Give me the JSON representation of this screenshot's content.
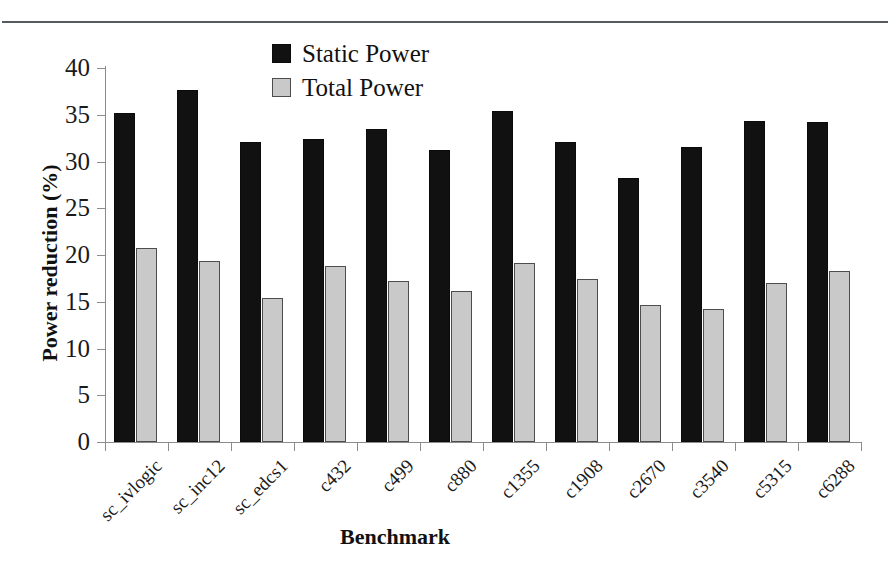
{
  "chart_data": {
    "type": "bar",
    "title": "",
    "xlabel": "Benchmark",
    "ylabel": "Power reduction (%)",
    "ylim": [
      0,
      40
    ],
    "yticks": [
      0,
      5,
      10,
      15,
      20,
      25,
      30,
      35,
      40
    ],
    "grid": false,
    "legend_position": "top-center",
    "categories": [
      "sc_ivlogic",
      "sc_inc12",
      "sc_edcs1",
      "c432",
      "c499",
      "c880",
      "c1355",
      "c1908",
      "c2670",
      "c3540",
      "c5315",
      "c6288"
    ],
    "series": [
      {
        "name": "Static Power",
        "color": "#111111",
        "values": [
          35.2,
          37.6,
          32.1,
          32.4,
          33.5,
          31.2,
          35.4,
          32.1,
          28.2,
          31.6,
          34.3,
          34.2
        ]
      },
      {
        "name": "Total Power",
        "color": "#c9c9c9",
        "values": [
          20.8,
          19.4,
          15.4,
          18.8,
          17.2,
          16.2,
          19.1,
          17.4,
          14.7,
          14.2,
          17.0,
          18.3
        ]
      }
    ]
  },
  "legend": {
    "items": [
      {
        "label": "Static Power",
        "swatch": "black-square"
      },
      {
        "label": "Total Power",
        "swatch": "gray-square"
      }
    ]
  },
  "axes": {
    "y_title": "Power reduction (%)",
    "x_title": "Benchmark",
    "y_tick_labels": [
      "40",
      "35",
      "30",
      "25",
      "20",
      "15",
      "10",
      "5",
      "0"
    ]
  }
}
